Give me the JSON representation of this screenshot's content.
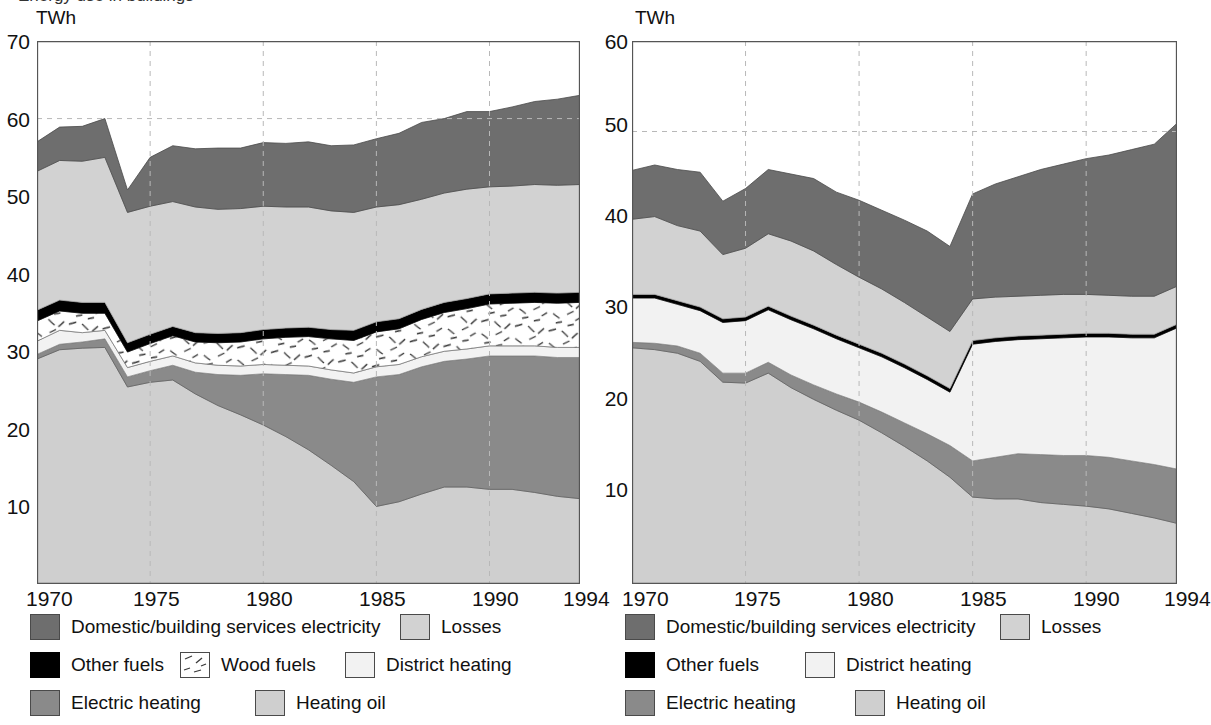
{
  "figure": {
    "background": "#ffffff",
    "top_cropped_heading": "Energy use in buildings"
  },
  "palette": {
    "domestic_electricity": "#6e6e6e",
    "losses": "#d2d2d2",
    "other_fuels": "#000000",
    "wood_fuels": "#ffffff",
    "district_heating": "#f2f2f2",
    "electric_heating": "#8a8a8a",
    "heating_oil": "#cfcfcf",
    "axis": "#555555",
    "grid": "#b8b8b8",
    "text": "#111111"
  },
  "panels": [
    {
      "id": "left",
      "unit": "TWh",
      "y_ticks": [
        "70",
        "60",
        "50",
        "40",
        "30",
        "20",
        "10"
      ],
      "x_ticks": [
        "1970",
        "1975",
        "1980",
        "1985",
        "1990",
        "1994"
      ],
      "legend": {
        "rows": [
          [
            {
              "label": "Domestic/building services electricity",
              "swatch": "domestic_electricity",
              "icon": "legend-swatch-domestic-electricity"
            },
            {
              "label": "Losses",
              "swatch": "losses",
              "icon": "legend-swatch-losses"
            }
          ],
          [
            {
              "label": "Other fuels",
              "swatch": "other_fuels",
              "icon": "legend-swatch-other-fuels"
            },
            {
              "label": "Wood fuels",
              "swatch": "wood_fuels",
              "icon": "legend-swatch-wood-fuels"
            },
            {
              "label": "District heating",
              "swatch": "district_heating",
              "icon": "legend-swatch-district-heating"
            }
          ],
          [
            {
              "label": "Electric heating",
              "swatch": "electric_heating",
              "icon": "legend-swatch-electric-heating"
            },
            {
              "label": "Heating oil",
              "swatch": "heating_oil",
              "icon": "legend-swatch-heating-oil"
            }
          ]
        ]
      }
    },
    {
      "id": "right",
      "unit": "TWh",
      "y_ticks": [
        "60",
        "50",
        "40",
        "30",
        "20",
        "10"
      ],
      "x_ticks": [
        "1970",
        "1975",
        "1980",
        "1985",
        "1990",
        "1994"
      ],
      "legend": {
        "rows": [
          [
            {
              "label": "Domestic/building services electricity",
              "swatch": "domestic_electricity",
              "icon": "legend-swatch-domestic-electricity"
            },
            {
              "label": "Losses",
              "swatch": "losses",
              "icon": "legend-swatch-losses"
            }
          ],
          [
            {
              "label": "Other fuels",
              "swatch": "other_fuels",
              "icon": "legend-swatch-other-fuels"
            },
            {
              "label": "District heating",
              "swatch": "district_heating",
              "icon": "legend-swatch-district-heating"
            }
          ],
          [
            {
              "label": "Electric heating",
              "swatch": "electric_heating",
              "icon": "legend-swatch-electric-heating"
            },
            {
              "label": "Heating oil",
              "swatch": "heating_oil",
              "icon": "legend-swatch-heating-oil"
            }
          ]
        ]
      }
    }
  ],
  "chart_data": [
    {
      "type": "area",
      "id": "left-chart",
      "title": "",
      "xlabel": "",
      "ylabel": "TWh",
      "xlim": [
        1970,
        1994
      ],
      "ylim": [
        0,
        70
      ],
      "grid": true,
      "grid_x_values": [
        1975,
        1980,
        1985,
        1990
      ],
      "grid_y_values": [
        60
      ],
      "legend_position": "below",
      "stack_order_bottom_to_top": [
        "Heating oil",
        "Electric heating",
        "District heating",
        "Wood fuels",
        "Other fuels",
        "Losses",
        "Domestic/building services electricity"
      ],
      "x": [
        1970,
        1971,
        1972,
        1973,
        1974,
        1975,
        1976,
        1977,
        1978,
        1979,
        1980,
        1981,
        1982,
        1983,
        1984,
        1985,
        1986,
        1987,
        1988,
        1989,
        1990,
        1991,
        1992,
        1993,
        1994
      ],
      "series": [
        {
          "name": "Heating oil",
          "values": [
            29.0,
            30.2,
            30.4,
            30.5,
            25.4,
            26.0,
            26.3,
            24.5,
            23.0,
            21.8,
            20.5,
            19.0,
            17.3,
            15.3,
            13.2,
            10.0,
            10.6,
            11.6,
            12.5,
            12.5,
            12.2,
            12.2,
            11.8,
            11.3,
            11.0
          ]
        },
        {
          "name": "Electric heating",
          "values": [
            0.6,
            0.7,
            0.8,
            1.1,
            1.3,
            1.5,
            1.9,
            2.8,
            4.0,
            5.1,
            6.6,
            8.0,
            9.6,
            11.1,
            12.8,
            16.7,
            16.4,
            16.4,
            16.2,
            16.5,
            17.2,
            17.2,
            17.6,
            17.9,
            18.2
          ]
        },
        {
          "name": "District heating",
          "values": [
            1.7,
            1.8,
            1.2,
            1.1,
            1.2,
            1.2,
            1.2,
            1.2,
            1.2,
            1.2,
            1.2,
            1.2,
            1.2,
            1.2,
            1.2,
            1.3,
            1.3,
            1.3,
            1.3,
            1.3,
            1.3,
            1.3,
            1.3,
            1.3,
            1.3
          ]
        },
        {
          "name": "Wood fuels",
          "values": [
            2.6,
            2.5,
            2.5,
            2.2,
            2.0,
            2.3,
            2.6,
            2.7,
            2.9,
            3.1,
            3.3,
            3.6,
            3.8,
            4.0,
            4.2,
            4.5,
            4.6,
            4.8,
            5.0,
            5.2,
            5.4,
            5.5,
            5.6,
            5.7,
            5.8
          ]
        },
        {
          "name": "Other fuels",
          "values": [
            1.4,
            1.4,
            1.4,
            1.4,
            1.2,
            1.2,
            1.2,
            1.2,
            1.2,
            1.2,
            1.2,
            1.2,
            1.2,
            1.2,
            1.3,
            1.3,
            1.3,
            1.3,
            1.3,
            1.3,
            1.3,
            1.3,
            1.3,
            1.3,
            1.3
          ]
        },
        {
          "name": "Losses",
          "values": [
            17.9,
            18.0,
            18.2,
            18.7,
            16.8,
            16.5,
            16.1,
            16.2,
            16.0,
            16.0,
            15.9,
            15.6,
            15.5,
            15.3,
            15.2,
            14.8,
            14.7,
            14.2,
            14.1,
            14.1,
            13.8,
            13.8,
            13.9,
            13.9,
            13.9
          ]
        },
        {
          "name": "Domestic/building services electricity",
          "values": [
            3.8,
            4.3,
            4.5,
            5.0,
            2.9,
            6.3,
            7.2,
            7.5,
            7.9,
            7.8,
            8.2,
            8.2,
            8.4,
            8.4,
            8.7,
            8.8,
            9.2,
            9.9,
            9.6,
            10.0,
            9.7,
            10.2,
            10.7,
            11.1,
            11.5
          ]
        }
      ]
    },
    {
      "type": "area",
      "id": "right-chart",
      "title": "",
      "xlabel": "",
      "ylabel": "TWh",
      "xlim": [
        1970,
        1994
      ],
      "ylim": [
        0,
        60
      ],
      "grid": true,
      "grid_x_values": [
        1975,
        1980,
        1985,
        1990
      ],
      "grid_y_values": [
        50
      ],
      "legend_position": "below",
      "stack_order_bottom_to_top": [
        "Heating oil",
        "Electric heating",
        "District heating",
        "Other fuels",
        "Losses",
        "Domestic/building services electricity"
      ],
      "x": [
        1970,
        1971,
        1972,
        1973,
        1974,
        1975,
        1976,
        1977,
        1978,
        1979,
        1980,
        1981,
        1982,
        1983,
        1984,
        1985,
        1986,
        1987,
        1988,
        1989,
        1990,
        1991,
        1992,
        1993,
        1994
      ],
      "series": [
        {
          "name": "Heating oil",
          "values": [
            26.1,
            25.9,
            25.5,
            24.6,
            22.3,
            22.2,
            23.3,
            21.7,
            20.4,
            19.2,
            18.1,
            16.7,
            15.2,
            13.6,
            11.8,
            9.6,
            9.4,
            9.4,
            9.0,
            8.8,
            8.6,
            8.3,
            7.8,
            7.3,
            6.7
          ]
        },
        {
          "name": "Electric heating",
          "values": [
            0.6,
            0.7,
            0.8,
            0.9,
            1.0,
            1.1,
            1.2,
            1.4,
            1.6,
            1.8,
            2.0,
            2.3,
            2.6,
            3.0,
            3.5,
            4.0,
            4.6,
            5.0,
            5.3,
            5.4,
            5.6,
            5.7,
            5.8,
            5.9,
            6.0
          ]
        },
        {
          "name": "District heating",
          "values": [
            4.9,
            5.0,
            4.6,
            4.7,
            5.6,
            5.8,
            5.8,
            6.1,
            6.2,
            6.1,
            6.0,
            6.1,
            6.1,
            6.0,
            5.9,
            12.9,
            12.8,
            12.6,
            12.8,
            13.0,
            13.1,
            13.3,
            13.6,
            14.0,
            15.6
          ]
        },
        {
          "name": "Other fuels",
          "values": [
            0.4,
            0.4,
            0.4,
            0.4,
            0.4,
            0.4,
            0.4,
            0.4,
            0.4,
            0.4,
            0.4,
            0.4,
            0.4,
            0.4,
            0.4,
            0.4,
            0.4,
            0.4,
            0.4,
            0.4,
            0.4,
            0.4,
            0.4,
            0.4,
            0.4
          ]
        },
        {
          "name": "Losses",
          "values": [
            8.3,
            8.6,
            8.3,
            8.4,
            7.1,
            7.6,
            8.0,
            8.3,
            8.2,
            7.8,
            7.4,
            7.1,
            6.8,
            6.5,
            6.3,
            4.6,
            4.5,
            4.4,
            4.4,
            4.4,
            4.3,
            4.2,
            4.2,
            4.2,
            4.2
          ]
        },
        {
          "name": "Domestic/building services electricity",
          "values": [
            5.4,
            5.7,
            6.2,
            6.5,
            5.9,
            6.6,
            7.1,
            7.4,
            8.0,
            8.0,
            8.5,
            8.7,
            9.1,
            9.5,
            9.4,
            11.6,
            12.5,
            13.2,
            13.9,
            14.4,
            15.0,
            15.5,
            16.2,
            16.8,
            18.0
          ]
        }
      ]
    }
  ]
}
